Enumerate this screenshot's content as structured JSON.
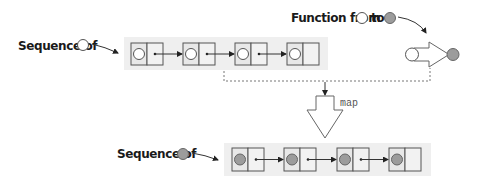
{
  "colors": {
    "strip": "#efefef",
    "filled_value": "#9c9c9c",
    "empty_value": "#ffffff",
    "stroke": "#555555"
  },
  "input_sequence": {
    "label": "Sequence of",
    "element_kind": "empty-circle",
    "node_count": 4
  },
  "function": {
    "label_prefix": "Function from",
    "label_middle": "to",
    "from_kind": "empty-circle",
    "to_kind": "filled-circle"
  },
  "operation": {
    "label": "map"
  },
  "output_sequence": {
    "label": "Sequence of",
    "element_kind": "filled-circle",
    "node_count": 4
  }
}
